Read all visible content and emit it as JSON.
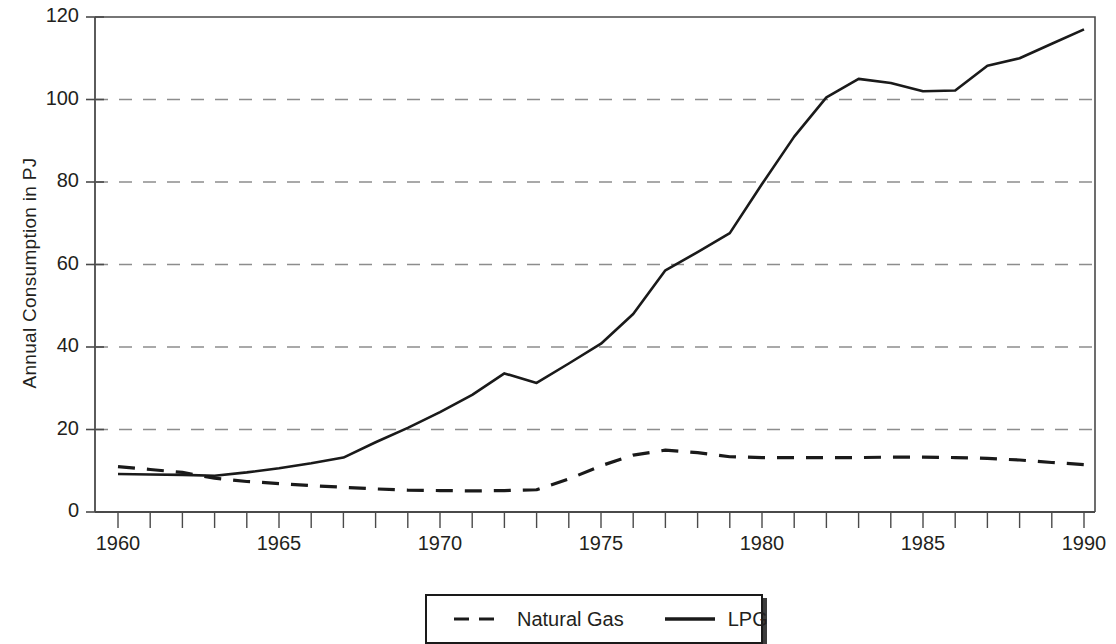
{
  "chart_data": {
    "type": "line",
    "title": "",
    "xlabel": "",
    "ylabel": "Annual Consumption in PJ",
    "xlim": [
      1960,
      1990
    ],
    "ylim": [
      0,
      120
    ],
    "ytick_labels": [
      "0",
      "20",
      "40",
      "60",
      "80",
      "100",
      "120"
    ],
    "ytick_values": [
      0,
      20,
      40,
      60,
      80,
      100,
      120
    ],
    "xtick_labels": [
      "1960",
      "1965",
      "1970",
      "1975",
      "1980",
      "1985",
      "1990"
    ],
    "xtick_values": [
      1960,
      1965,
      1970,
      1975,
      1980,
      1985,
      1990
    ],
    "minor_xticks_every": 1,
    "grid": "horizontal-dashed",
    "legend_position": "below-center",
    "x": [
      1960,
      1961,
      1962,
      1963,
      1964,
      1965,
      1966,
      1967,
      1968,
      1969,
      1970,
      1971,
      1972,
      1973,
      1974,
      1975,
      1976,
      1977,
      1978,
      1979,
      1980,
      1981,
      1982,
      1983,
      1984,
      1985,
      1986,
      1987,
      1988,
      1989,
      1990
    ],
    "series": [
      {
        "name": "Natural Gas",
        "style": "dashed",
        "color": "#1a1a1a",
        "values": [
          11.0,
          10.3,
          9.6,
          8.2,
          7.4,
          6.9,
          6.4,
          6.0,
          5.6,
          5.3,
          5.2,
          5.1,
          5.2,
          5.4,
          8.0,
          11.2,
          13.8,
          15.0,
          14.4,
          13.4,
          13.2,
          13.2,
          13.2,
          13.2,
          13.3,
          13.3,
          13.2,
          13.0,
          12.6,
          12.0,
          11.5
        ]
      },
      {
        "name": "LPG",
        "style": "solid",
        "color": "#1a1a1a",
        "values": [
          9.2,
          9.1,
          9.0,
          8.8,
          9.6,
          10.6,
          11.8,
          13.2,
          16.9,
          20.4,
          24.2,
          28.4,
          33.6,
          31.3,
          36.0,
          40.8,
          48.0,
          58.6,
          63.0,
          67.6,
          79.5,
          91.0,
          100.5,
          105.0,
          104.0,
          102.0,
          102.2,
          108.2,
          110.0,
          113.5,
          117.0
        ]
      }
    ]
  },
  "legend": {
    "entries": [
      {
        "label": "Natural Gas",
        "style": "dashed"
      },
      {
        "label": "LPG",
        "style": "solid"
      }
    ]
  },
  "axes": {
    "y_title": "Annual Consumption in PJ"
  }
}
